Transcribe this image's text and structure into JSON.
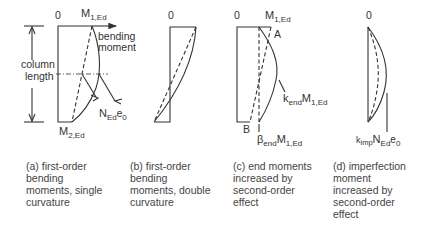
{
  "diagram": {
    "panels": [
      {
        "id": "a",
        "top_zero": "0",
        "top_moment": "M",
        "top_moment_sub": "1,Ed",
        "bottom_moment": "M",
        "bottom_moment_sub": "2,Ed",
        "axis_label_1": "bending",
        "axis_label_2": "moment",
        "dimension_label_1": "column",
        "dimension_label_2": "length",
        "imperfection_label": "N",
        "imperfection_sub": "Ed",
        "imperfection_tail": "e",
        "imperfection_tail_sub": "0",
        "caption": "(a) first-order\nbending\nmoments, single\ncurvature"
      },
      {
        "id": "b",
        "top_zero": "0",
        "caption": "(b) first-order\nbending\nmoments, double\ncurvature"
      },
      {
        "id": "c",
        "top_zero": "0",
        "top_moment": "M",
        "top_moment_sub": "1,Ed",
        "point_a": "A",
        "point_b": "B",
        "k_label": "k",
        "k_sub": "end",
        "k_moment": "M",
        "k_moment_sub": "1,Ed",
        "beta_label": "β",
        "beta_sub": "end",
        "beta_moment": "M",
        "beta_moment_sub": "1,Ed",
        "caption": "(c) end moments\nincreased by\nsecond-order\neffect"
      },
      {
        "id": "d",
        "top_zero": "0",
        "k_label": "k",
        "k_sub": "imp",
        "n_label": "N",
        "n_sub": "Ed",
        "e_label": "e",
        "e_sub": "0",
        "caption": "(d) imperfection\nmoment\nincreased by\nsecond-order\neffect"
      }
    ]
  }
}
